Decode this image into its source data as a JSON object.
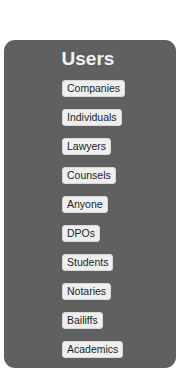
{
  "panel": {
    "title": "Users",
    "background": "#606060",
    "items": [
      {
        "label": "Companies"
      },
      {
        "label": "Individuals"
      },
      {
        "label": "Lawyers"
      },
      {
        "label": "Counsels"
      },
      {
        "label": "Anyone"
      },
      {
        "label": "DPOs"
      },
      {
        "label": "Students"
      },
      {
        "label": "Notaries"
      },
      {
        "label": "Bailiffs"
      },
      {
        "label": "Academics"
      }
    ]
  }
}
